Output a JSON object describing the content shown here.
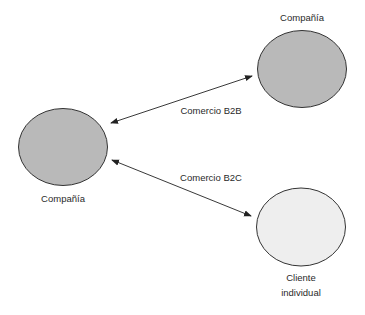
{
  "nodes": [
    {
      "id": "company_top",
      "label": "Compañía",
      "fill": "#b9b9b9"
    },
    {
      "id": "company_left",
      "label": "Compañía",
      "fill": "#b9b9b9"
    },
    {
      "id": "individual_client",
      "label_line1": "Cliente",
      "label_line2": "individual",
      "fill": "#eeeeee"
    }
  ],
  "edges": [
    {
      "from": "company_left",
      "to": "company_top",
      "label": "Comercio B2B",
      "bidirectional": true
    },
    {
      "from": "company_left",
      "to": "individual_client",
      "label": "Comercio B2C",
      "bidirectional": true
    }
  ],
  "colors": {
    "stroke": "#333333",
    "company_fill": "#b9b9b9",
    "client_fill": "#eeeeee"
  }
}
